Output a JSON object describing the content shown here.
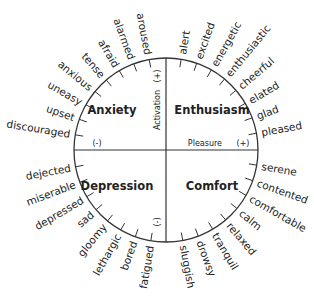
{
  "quadrants": {
    "top_left": {
      "label": "Anxiety",
      "words": [
        "aroused",
        "alarmed",
        "afraid",
        "tense",
        "anxious",
        "uneasy",
        "upset",
        "discouraged"
      ]
    },
    "top_right": {
      "label": "Enthusiasm",
      "words": [
        "alert",
        "excited",
        "energetic",
        "enthusiastic",
        "cheerful",
        "elated",
        "glad",
        "pleased"
      ]
    },
    "bottom_right": {
      "label": "Comfort",
      "words": [
        "serene",
        "contented",
        "comfortable",
        "calm",
        "relaxed",
        "tranquil",
        "drowsy",
        "sluggish"
      ]
    },
    "bottom_left": {
      "label": "Depression",
      "words": [
        "fatigued",
        "bored",
        "lethargic",
        "gloomy",
        "sad",
        "depressed",
        "miserable",
        "dejected"
      ]
    }
  },
  "axes": {
    "activation_label": "Activation",
    "activation_pos": "(+)",
    "activation_neg": "(-)",
    "pleasure_label": "Pleasure",
    "pleasure_pos": "(+)",
    "pleasure_neg": "(-)"
  }
}
